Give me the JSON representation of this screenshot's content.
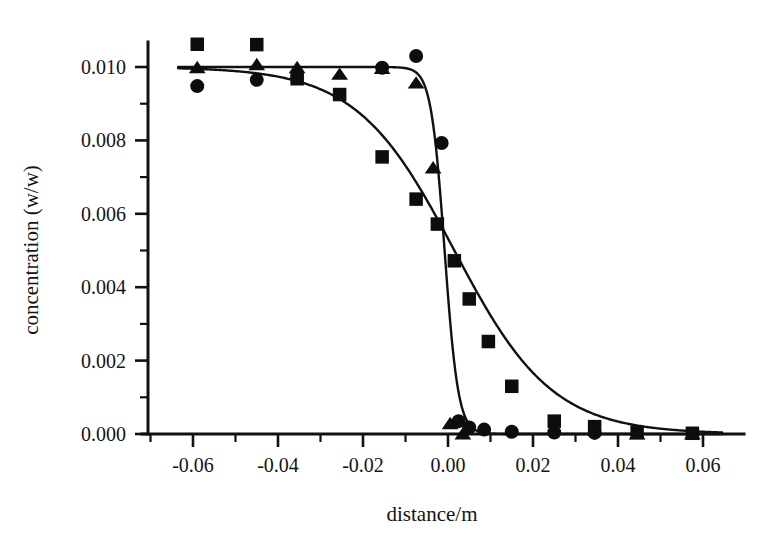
{
  "chart_data": {
    "type": "scatter",
    "title": "",
    "xlabel": "distance/m",
    "ylabel": "concentration (w/w)",
    "xlim": [
      -0.07,
      0.07
    ],
    "ylim": [
      0.0,
      0.0112
    ],
    "grid": false,
    "legend_position": "none",
    "x_ticks": [
      "-0.06",
      "-0.04",
      "-0.02",
      "0.00",
      "0.02",
      "0.04",
      "0.06"
    ],
    "x_tick_values": [
      -0.06,
      -0.04,
      -0.02,
      0.0,
      0.02,
      0.04,
      0.06
    ],
    "x_minor_step": 0.01,
    "y_ticks": [
      "0.000",
      "0.002",
      "0.004",
      "0.006",
      "0.008",
      "0.010"
    ],
    "y_tick_values": [
      0.0,
      0.002,
      0.004,
      0.006,
      0.008,
      0.01
    ],
    "y_minor_step": 0.001,
    "series": [
      {
        "name": "squares",
        "marker": "square",
        "x": [
          -0.059,
          -0.045,
          -0.0355,
          -0.0255,
          -0.0155,
          -0.0075,
          -0.0025,
          0.0015,
          0.005,
          0.0095,
          0.015,
          0.025,
          0.0345,
          0.0445,
          0.0575
        ],
        "values": [
          0.01062,
          0.01061,
          0.00968,
          0.00925,
          0.00755,
          0.0064,
          0.00572,
          0.00472,
          0.00368,
          0.00252,
          0.0013,
          0.00035,
          0.0002,
          4e-05,
          2e-05
        ]
      },
      {
        "name": "triangles",
        "marker": "triangle",
        "x": [
          -0.059,
          -0.045,
          -0.0355,
          -0.0255,
          -0.0155,
          -0.0075,
          -0.0035,
          0.0005,
          0.0035,
          0.0445,
          0.0575
        ],
        "values": [
          0.01,
          0.01008,
          0.01,
          0.00982,
          0.00998,
          0.00958,
          0.00727,
          0.0003,
          2e-05,
          2e-05,
          2e-05
        ]
      },
      {
        "name": "circles",
        "marker": "circle",
        "x": [
          -0.059,
          -0.045,
          -0.0355,
          -0.0155,
          -0.0075,
          -0.0015,
          0.0025,
          0.005,
          0.0085,
          0.015,
          0.025,
          0.0345
        ],
        "values": [
          0.00948,
          0.00965,
          0.0097,
          0.00998,
          0.0103,
          0.00793,
          0.00035,
          0.00018,
          0.00012,
          6e-05,
          4e-05,
          3e-05
        ]
      }
    ],
    "fit_curves": [
      {
        "name": "gradual-sigmoid-fit",
        "description": "broad sigmoid through square markers",
        "midpoint": 0.0015,
        "amplitude": 0.01,
        "width": 0.0115
      },
      {
        "name": "steep-sigmoid-fit",
        "description": "sharp sigmoid through triangle and circle markers",
        "midpoint": -0.0008,
        "amplitude": 0.01,
        "width": 0.0016
      }
    ]
  },
  "axes": {
    "x_title": "distance/m",
    "y_title": "concentration (w/w)"
  }
}
